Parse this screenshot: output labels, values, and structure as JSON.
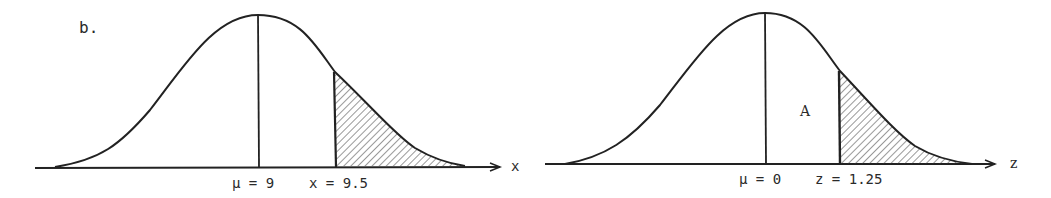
{
  "part_label": "b.",
  "left": {
    "axis_label": "x",
    "mu_label": "μ = 9",
    "x_label": "x = 9.5",
    "mean": 9,
    "x_value": 9.5
  },
  "right": {
    "axis_label": "z",
    "mu_label": "μ = 0",
    "z_label": "z = 1.25",
    "area_label": "A",
    "mean": 0,
    "z_value": 1.25
  },
  "colors": {
    "ink": "#222222",
    "background": "#ffffff"
  }
}
